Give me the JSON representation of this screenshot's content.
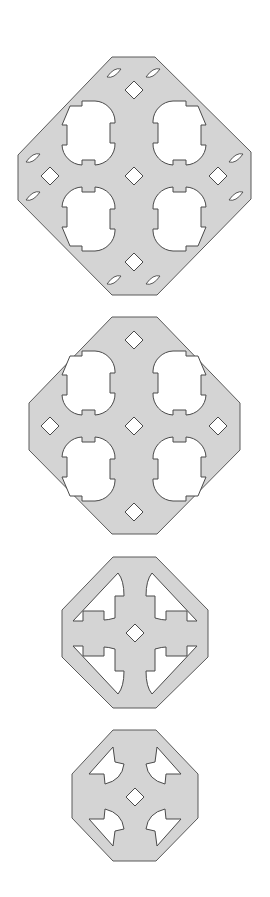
{
  "figure": {
    "colors": {
      "plate": "#d4d4d4",
      "outline": "#5a5a5a",
      "background": "#ffffff"
    },
    "shapes": [
      {
        "id": "plate-1",
        "center": [
          134,
          176
        ],
        "bbox": [
          18,
          57,
          251,
          295
        ],
        "features": [
          "4 lobed openings",
          "5 diamond holes",
          "8 slot cutouts"
        ]
      },
      {
        "id": "plate-2",
        "center": [
          134,
          426
        ],
        "bbox": [
          29,
          317,
          240,
          534
        ],
        "features": [
          "4 lobed openings",
          "5 diamond holes"
        ]
      },
      {
        "id": "plate-3",
        "center": [
          135,
          633
        ],
        "bbox": [
          62,
          557,
          208,
          708
        ],
        "features": [
          "4 arrow openings",
          "1 diamond hole"
        ]
      },
      {
        "id": "plate-4",
        "center": [
          135,
          796
        ],
        "bbox": [
          72,
          730,
          198,
          861
        ],
        "features": [
          "4 small arrow openings",
          "1 diamond hole"
        ]
      }
    ]
  }
}
